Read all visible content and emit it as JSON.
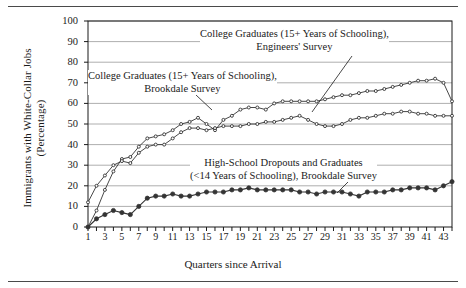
{
  "chart_data": {
    "type": "line",
    "title": "",
    "xlabel": "Quarters since Arrival",
    "ylabel": "Immigrants with White-Collar Jobs (Percentage)",
    "xlim": [
      1,
      44
    ],
    "ylim": [
      0,
      100
    ],
    "yticks": [
      0,
      10,
      20,
      30,
      40,
      50,
      60,
      70,
      80,
      90,
      100
    ],
    "xticks": [
      1,
      3,
      5,
      7,
      9,
      11,
      13,
      15,
      17,
      19,
      21,
      23,
      25,
      27,
      29,
      31,
      33,
      35,
      37,
      39,
      41,
      43
    ],
    "grid": "horizontal",
    "legend_position": "inline-annotations",
    "x": [
      1,
      2,
      3,
      4,
      5,
      6,
      7,
      8,
      9,
      10,
      11,
      12,
      13,
      14,
      15,
      16,
      17,
      18,
      19,
      20,
      21,
      22,
      23,
      24,
      25,
      26,
      27,
      28,
      29,
      30,
      31,
      32,
      33,
      34,
      35,
      36,
      37,
      38,
      39,
      40,
      41,
      42,
      43,
      44
    ],
    "series": [
      {
        "name": "College Graduates (15+ Years of Schooling), Engineers' Survey",
        "marker": "open-dot",
        "values": [
          0,
          8,
          18,
          27,
          33,
          34,
          39,
          43,
          44,
          45,
          47,
          50,
          51,
          53,
          50,
          47,
          52,
          54,
          57,
          58,
          58,
          57,
          60,
          61,
          61,
          61,
          61,
          61,
          62,
          63,
          64,
          64,
          65,
          66,
          66,
          67,
          68,
          69,
          70,
          71,
          71,
          72,
          70,
          61
        ]
      },
      {
        "name": "College Graduates (15+ Years of Schooling), Brookdale Survey",
        "marker": "open-dot",
        "values": [
          12,
          20,
          25,
          30,
          32,
          31,
          36,
          39,
          40,
          40,
          43,
          46,
          48,
          48,
          47,
          48,
          49,
          49,
          49,
          50,
          50,
          51,
          51,
          52,
          53,
          54,
          52,
          50,
          49,
          49,
          50,
          52,
          53,
          53,
          54,
          55,
          55,
          56,
          56,
          55,
          55,
          54,
          54,
          54
        ]
      },
      {
        "name": "High-School Dropouts and Graduates (<14 Years of Schooling), Brookdale Survey",
        "marker": "filled-dot",
        "values": [
          0,
          4,
          6,
          8,
          7,
          6,
          10,
          14,
          15,
          15,
          16,
          15,
          15,
          16,
          17,
          17,
          17,
          18,
          18,
          19,
          18,
          18,
          18,
          18,
          18,
          17,
          17,
          16,
          17,
          17,
          17,
          16,
          15,
          17,
          17,
          17,
          18,
          18,
          19,
          19,
          19,
          18,
          20,
          22
        ]
      }
    ]
  },
  "annotations": [
    {
      "id": "engineers",
      "line1": "College Graduates (15+ Years of Schooling),",
      "line2": "Engineers' Survey"
    },
    {
      "id": "brookdale_college",
      "line1": "College Graduates (15+ Years of Schooling),",
      "line2": "Brookdale Survey"
    },
    {
      "id": "high_school",
      "line1": "High-School Dropouts and Graduates",
      "line2": "(<14 Years of Schooling), Brookdale Survey"
    }
  ],
  "colors": {
    "line": "#333333",
    "grid": "#999999",
    "axis": "#1a1a1a",
    "background": "#ffffff"
  }
}
